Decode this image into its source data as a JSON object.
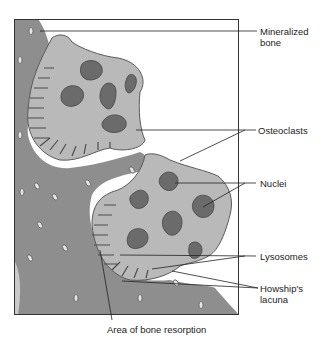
{
  "figure": {
    "colors": {
      "bone": "#8e8e8e",
      "bone_dark": "#7a7a7a",
      "cell": "#b9b9b9",
      "cell_outline": "#5a5a5a",
      "nucleus": "#6b6b6b",
      "frame": "#333333",
      "leader": "#222222"
    },
    "labels": [
      {
        "id": "mineralized-bone",
        "text": "Mineralized\nbone",
        "x": 260,
        "y": 26
      },
      {
        "id": "osteoclasts",
        "text": "Osteoclasts",
        "x": 258,
        "y": 126
      },
      {
        "id": "nuclei",
        "text": "Nuclei",
        "x": 260,
        "y": 179
      },
      {
        "id": "lysosomes",
        "text": "Lysosomes",
        "x": 260,
        "y": 252
      },
      {
        "id": "howships-lacuna",
        "text": "Howship's\nlacuna",
        "x": 260,
        "y": 282
      },
      {
        "id": "area-of-bone-resorption",
        "text": "Area of bone resorption",
        "x": 107,
        "y": 324
      }
    ]
  }
}
